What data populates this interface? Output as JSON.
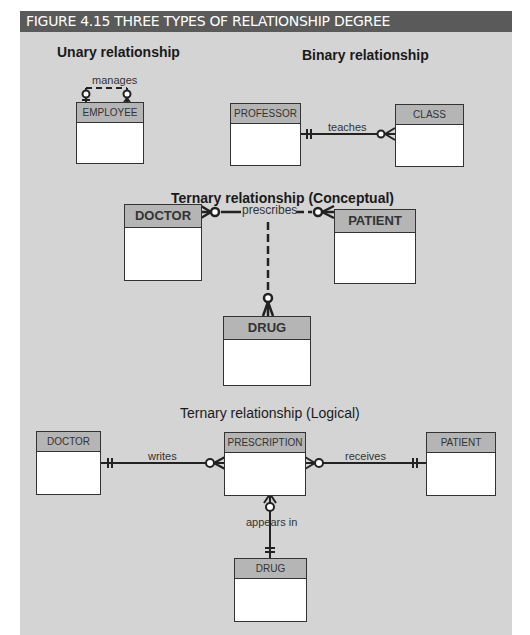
{
  "figure": {
    "title": "FIGURE 4.15  THREE TYPES OF RELATIONSHIP DEGREE",
    "header_color": "#5a5a5a",
    "background_color": "#d4d4d4"
  },
  "unary": {
    "caption": "Unary relationship",
    "entity": "EMPLOYEE",
    "relationship": "manages"
  },
  "binary": {
    "caption": "Binary relationship",
    "entities": [
      "PROFESSOR",
      "CLASS"
    ],
    "relationship": "teaches"
  },
  "ternary_conceptual": {
    "caption": "Ternary relationship (Conceptual)",
    "entities": [
      "DOCTOR",
      "PATIENT",
      "DRUG"
    ],
    "relationship": "prescribes"
  },
  "ternary_logical": {
    "caption": "Ternary relationship (Logical)",
    "entities": [
      "DOCTOR",
      "PRESCRIPTION",
      "PATIENT",
      "DRUG"
    ],
    "relationships": [
      "writes",
      "receives",
      "appears in"
    ]
  }
}
